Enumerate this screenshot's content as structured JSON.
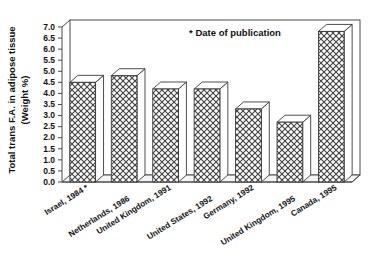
{
  "chart_data": {
    "type": "bar",
    "title": "",
    "subtitle": "",
    "xlabel": "",
    "ylabel": "Total trans F.A. in adipose tissue (Weight %)",
    "ylabel_line1": "Total trans F.A. in adipose tissue",
    "ylabel_line2": "(Weight %)",
    "categories": [
      "Israel, 1984 *",
      "Netherlands, 1986",
      "United Kingdom, 1991",
      "United States, 1992",
      "Germany, 1992",
      "United Kingdom, 1995",
      "Canada, 1995"
    ],
    "values": [
      4.5,
      4.8,
      4.2,
      4.2,
      3.3,
      2.7,
      6.8
    ],
    "ylim": [
      0.0,
      7.0
    ],
    "ytick_step": 0.5,
    "ytick_labels": [
      "7.0",
      "6.5",
      "6.0",
      "5.5",
      "5.0",
      "4.5",
      "4.0",
      "3.5",
      "3.0",
      "2.5",
      "2.0",
      "1.5",
      "1.0",
      "0.5",
      "0.0"
    ],
    "grid": false,
    "legend": "none",
    "annotations": [
      {
        "text": "* Date of publication",
        "x_frac": 0.58,
        "y_value": 6.55
      }
    ],
    "style": {
      "bar_fill": "crosshatch",
      "bar_edge": "#3a3a3a",
      "frame": "#4a4a4a",
      "background": "#ffffff",
      "three_d": true
    }
  }
}
